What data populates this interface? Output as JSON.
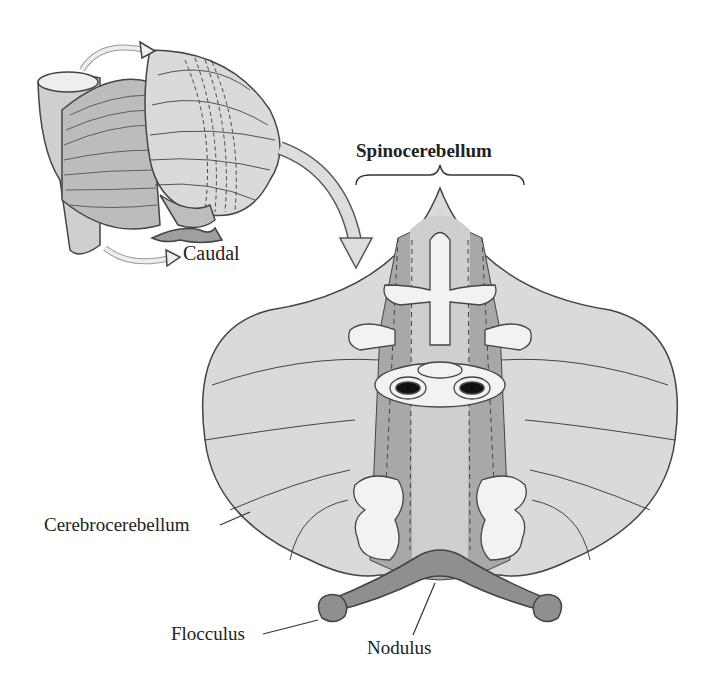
{
  "figure": {
    "labels": {
      "caudal": "Caudal",
      "spinocerebellum": "Spinocerebellum",
      "cerebrocerebellum": "Cerebrocerebellum",
      "flocculus": "Flocculus",
      "nodulus": "Nodulus"
    },
    "colors": {
      "background": "#ffffff",
      "lobe_light": "#dcdcdc",
      "lobe_mid": "#bdbdbd",
      "vermis_dark": "#9a9a9a",
      "outline": "#444444",
      "text": "#222222"
    }
  }
}
